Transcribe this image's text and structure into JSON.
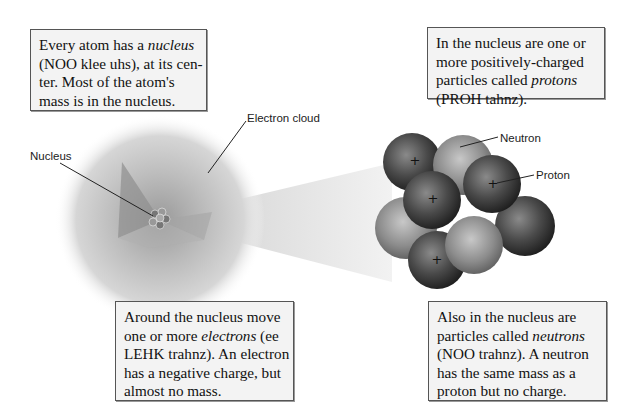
{
  "boxes": {
    "nucleus": {
      "parts": [
        "Every atom has a ",
        "nucleus",
        " (NOO klee uhs), at its center. Most of the atom's mass is in the nucleus."
      ],
      "lines": [
        "Every atom has a |nucleus|",
        "(NOO klee uhs), at its cen-",
        "ter. Most of the atom's",
        "mass is in the nucleus."
      ]
    },
    "protons": {
      "lines": [
        "In the nucleus are one or",
        "more positively-charged",
        "particles called |protons|",
        "(PROH tahnz)."
      ]
    },
    "electrons": {
      "lines": [
        "Around the nucleus move",
        "one or more |electrons| (ee",
        "LEHK trahnz). An electron",
        "has a negative charge, but",
        "almost no mass."
      ]
    },
    "neutrons": {
      "lines": [
        "Also in the nucleus are",
        "particles called |neutrons|",
        "(NOO trahnz). A neutron",
        "has the same mass as a",
        "proton but no charge."
      ]
    }
  },
  "labels": {
    "electron_cloud": "Electron cloud",
    "nucleus": "Nucleus",
    "neutron": "Neutron",
    "proton": "Proton"
  },
  "particles": {
    "proton_symbol": "+",
    "proton_color": "#3a3a3a",
    "neutron_color": "#8a8a8a"
  }
}
